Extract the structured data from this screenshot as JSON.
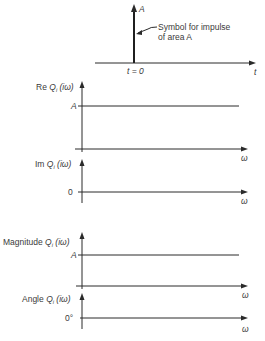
{
  "impulse": {
    "amplitude_label": "A",
    "annotation_line1": "Symbol for impulse",
    "annotation_line2": "of area A",
    "time_label": "t = 0",
    "axis_label": "t"
  },
  "plots": [
    {
      "id": "re",
      "ylabel_prefix": "Re",
      "ylabel_fn": "Q",
      "ylabel_sub": "i",
      "ylabel_arg": "(iω)",
      "level_label": "A",
      "xlabel": "ω"
    },
    {
      "id": "im",
      "ylabel_prefix": "Im",
      "ylabel_fn": "Q",
      "ylabel_sub": "i",
      "ylabel_arg": "(iω)",
      "level_label": "0",
      "xlabel": "ω"
    },
    {
      "id": "magnitude",
      "ylabel_prefix": "Magnitude",
      "ylabel_fn": "Q",
      "ylabel_sub": "i",
      "ylabel_arg": "(iω)",
      "level_label": "A",
      "xlabel": "ω"
    },
    {
      "id": "angle",
      "ylabel_prefix": "Angle",
      "ylabel_fn": "Q",
      "ylabel_sub": "i",
      "ylabel_arg": "(iω)",
      "level_label": "0°",
      "xlabel": "ω"
    }
  ],
  "colors": {
    "line": "#2a2a2a",
    "text": "#3a3a3a",
    "background": "#ffffff"
  }
}
